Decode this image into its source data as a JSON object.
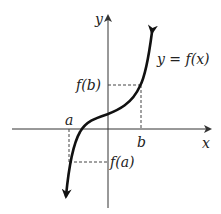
{
  "diagram": {
    "axes": {
      "x_label": "x",
      "y_label": "y"
    },
    "curve_label": "y = f(x)",
    "points": {
      "a_label": "a",
      "b_label": "b",
      "fa_label": "f(a)",
      "fb_label": "f(b)"
    },
    "colors": {
      "curve": "#111111",
      "axis": "#333333",
      "dashed": "#444444"
    }
  }
}
